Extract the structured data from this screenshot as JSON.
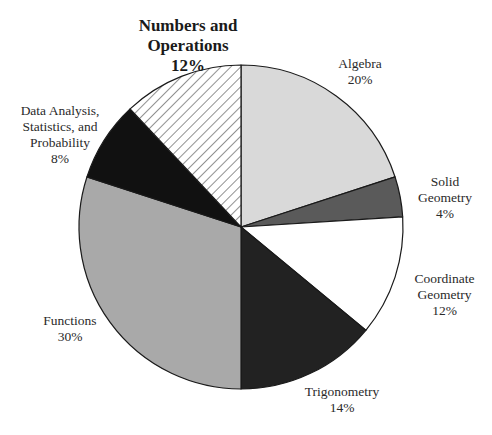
{
  "chart_data": {
    "type": "pie",
    "title": "",
    "start_angle_deg": 0,
    "direction": "clockwise",
    "slices": [
      {
        "label": "Algebra",
        "lines": [
          "Algebra"
        ],
        "value": 20,
        "display": "20%",
        "color": "#d9d9d9",
        "pattern": "solid"
      },
      {
        "label": "Solid Geometry",
        "lines": [
          "Solid",
          "Geometry"
        ],
        "value": 4,
        "display": "4%",
        "color": "#5a5a5a",
        "pattern": "solid"
      },
      {
        "label": "Coordinate Geometry",
        "lines": [
          "Coordinate",
          "Geometry"
        ],
        "value": 12,
        "display": "12%",
        "color": "#ffffff",
        "pattern": "solid"
      },
      {
        "label": "Trigonometry",
        "lines": [
          "Trigonometry"
        ],
        "value": 14,
        "display": "14%",
        "color": "#222222",
        "pattern": "solid"
      },
      {
        "label": "Functions",
        "lines": [
          "Functions"
        ],
        "value": 30,
        "display": "30%",
        "color": "#a9a9a9",
        "pattern": "solid"
      },
      {
        "label": "Data Analysis, Statistics, and Probability",
        "lines": [
          "Data Analysis,",
          "Statistics, and",
          "Probability"
        ],
        "value": 8,
        "display": "8%",
        "color": "#111111",
        "pattern": "solid"
      },
      {
        "label": "Numbers and Operations",
        "lines": [
          "Numbers and",
          "Operations"
        ],
        "value": 12,
        "display": "12%",
        "color": "#ffffff",
        "pattern": "diagonal-hatch",
        "emphasized": true
      }
    ]
  },
  "labels": {
    "algebra": {
      "line1": "Algebra",
      "pct": "20%"
    },
    "solid_geometry": {
      "line1": "Solid",
      "line2": "Geometry",
      "pct": "4%"
    },
    "coordinate_geometry": {
      "line1": "Coordinate",
      "line2": "Geometry",
      "pct": "12%"
    },
    "trigonometry": {
      "line1": "Trigonometry",
      "pct": "14%"
    },
    "functions": {
      "line1": "Functions",
      "pct": "30%"
    },
    "data_analysis": {
      "line1": "Data Analysis,",
      "line2": "Statistics, and",
      "line3": "Probability",
      "pct": "8%"
    },
    "numbers_operations": {
      "line1": "Numbers and",
      "line2": "Operations",
      "pct": "12%"
    }
  },
  "colors": {
    "outline": "#1a1a1a",
    "hatch": "#555555"
  }
}
